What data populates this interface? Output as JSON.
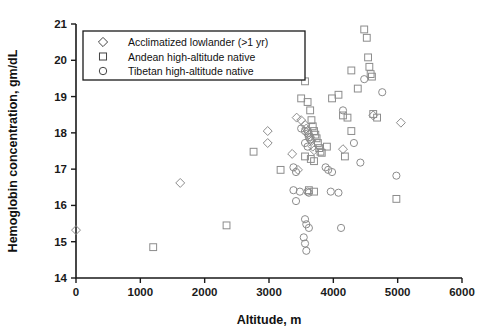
{
  "chart_data": {
    "type": "scatter",
    "title": "",
    "xlabel": "Altitude, m",
    "ylabel": "Hemoglobin concentration, gm/dL",
    "xlim": [
      0,
      6000
    ],
    "ylim": [
      14,
      21
    ],
    "xticks": [
      "0",
      "1000",
      "2000",
      "3000",
      "4000",
      "5000",
      "6000"
    ],
    "yticks": [
      "14",
      "15",
      "16",
      "17",
      "18",
      "19",
      "20",
      "21"
    ],
    "grid": false,
    "legend_position": "top-left-inside",
    "series": [
      {
        "name": "Acclimatized lowlander (>1 yr)",
        "marker": "diamond",
        "color": "#8c8c8c",
        "points": [
          [
            0,
            15.32
          ],
          [
            1620,
            16.62
          ],
          [
            2980,
            18.05
          ],
          [
            2980,
            17.72
          ],
          [
            3360,
            17.42
          ],
          [
            3430,
            18.42
          ],
          [
            3500,
            18.35
          ],
          [
            3560,
            18.22
          ],
          [
            3580,
            18.12
          ],
          [
            3600,
            18.05
          ],
          [
            3620,
            17.95
          ],
          [
            3640,
            17.88
          ],
          [
            3660,
            17.78
          ],
          [
            3680,
            17.62
          ],
          [
            3700,
            17.52
          ],
          [
            3450,
            16.98
          ],
          [
            4150,
            17.55
          ],
          [
            4620,
            18.48
          ],
          [
            5050,
            18.28
          ]
        ]
      },
      {
        "name": "Andean high-altitude  native",
        "marker": "square",
        "color": "#8c8c8c",
        "points": [
          [
            1200,
            14.85
          ],
          [
            2340,
            15.45
          ],
          [
            2760,
            17.48
          ],
          [
            3180,
            16.98
          ],
          [
            3500,
            18.95
          ],
          [
            3560,
            19.42
          ],
          [
            3600,
            18.85
          ],
          [
            3640,
            18.62
          ],
          [
            3660,
            18.35
          ],
          [
            3680,
            18.18
          ],
          [
            3700,
            18.05
          ],
          [
            3720,
            17.95
          ],
          [
            3740,
            17.85
          ],
          [
            3760,
            17.72
          ],
          [
            3780,
            17.58
          ],
          [
            3800,
            17.48
          ],
          [
            3560,
            17.35
          ],
          [
            3650,
            17.28
          ],
          [
            3700,
            17.22
          ],
          [
            3820,
            17.45
          ],
          [
            3900,
            17.62
          ],
          [
            3620,
            16.42
          ],
          [
            3700,
            16.38
          ],
          [
            3980,
            18.95
          ],
          [
            4080,
            19.05
          ],
          [
            4150,
            18.48
          ],
          [
            4220,
            18.42
          ],
          [
            4280,
            18.05
          ],
          [
            4180,
            17.35
          ],
          [
            4380,
            19.22
          ],
          [
            4480,
            20.85
          ],
          [
            4520,
            20.62
          ],
          [
            4540,
            20.08
          ],
          [
            4560,
            19.82
          ],
          [
            4580,
            19.62
          ],
          [
            4600,
            19.55
          ],
          [
            4280,
            19.72
          ],
          [
            4620,
            18.52
          ],
          [
            4680,
            18.42
          ],
          [
            4980,
            16.18
          ]
        ]
      },
      {
        "name": "Tibetan high-altitude native",
        "marker": "circle",
        "color": "#8c8c8c",
        "points": [
          [
            3500,
            18.12
          ],
          [
            3560,
            18.05
          ],
          [
            3600,
            17.98
          ],
          [
            3620,
            17.88
          ],
          [
            3640,
            17.82
          ],
          [
            3560,
            17.72
          ],
          [
            3600,
            17.62
          ],
          [
            3380,
            17.05
          ],
          [
            3420,
            16.92
          ],
          [
            3380,
            16.42
          ],
          [
            3480,
            16.38
          ],
          [
            3600,
            16.38
          ],
          [
            3620,
            16.35
          ],
          [
            3420,
            16.12
          ],
          [
            3560,
            15.62
          ],
          [
            3580,
            15.48
          ],
          [
            3620,
            15.38
          ],
          [
            3540,
            15.12
          ],
          [
            3560,
            14.95
          ],
          [
            3580,
            14.75
          ],
          [
            3880,
            17.05
          ],
          [
            3920,
            16.98
          ],
          [
            3980,
            16.92
          ],
          [
            3960,
            16.38
          ],
          [
            4080,
            16.35
          ],
          [
            4150,
            18.62
          ],
          [
            4320,
            17.72
          ],
          [
            4420,
            17.18
          ],
          [
            4480,
            19.48
          ],
          [
            4760,
            19.12
          ],
          [
            4980,
            16.82
          ],
          [
            4120,
            15.38
          ]
        ]
      }
    ]
  },
  "legend": {
    "entries": [
      {
        "label": "Acclimatized lowlander (>1 yr)",
        "marker": "diamond"
      },
      {
        "label": "Andean high-altitude  native",
        "marker": "square"
      },
      {
        "label": "Tibetan high-altitude native",
        "marker": "circle"
      }
    ]
  }
}
